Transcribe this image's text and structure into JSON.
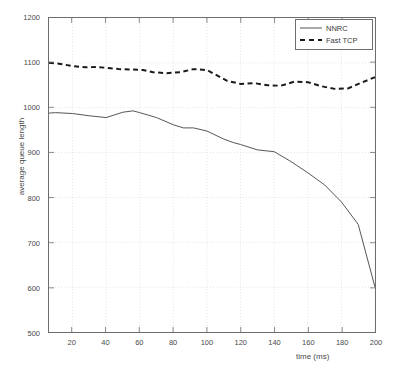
{
  "chart_data": {
    "type": "line",
    "title": "",
    "xlabel": "time (ms)",
    "ylabel": "average queue length",
    "xlim": [
      6,
      200
    ],
    "ylim": [
      500,
      1200
    ],
    "xticks": [
      20,
      40,
      60,
      80,
      100,
      120,
      140,
      160,
      180,
      200
    ],
    "yticks": [
      500,
      600,
      700,
      800,
      900,
      1000,
      1100,
      1200
    ],
    "grid": true,
    "grid_style": "dotted",
    "legend_position": "top-right",
    "series": [
      {
        "name": "NNRC",
        "style": "solid",
        "color": "#555555",
        "width": 1,
        "x": [
          6,
          10,
          20,
          30,
          40,
          50,
          56,
          60,
          70,
          80,
          86,
          92,
          100,
          110,
          116,
          120,
          130,
          140,
          150,
          160,
          170,
          180,
          190,
          200
        ],
        "y": [
          988,
          989,
          987,
          982,
          978,
          990,
          993,
          989,
          978,
          962,
          955,
          955,
          948,
          930,
          922,
          918,
          906,
          902,
          880,
          855,
          828,
          790,
          740,
          600
        ]
      },
      {
        "name": "Fast TCP",
        "style": "dashed",
        "color": "#1a1a1a",
        "width": 2,
        "x": [
          6,
          12,
          20,
          28,
          34,
          40,
          48,
          56,
          62,
          68,
          76,
          84,
          92,
          100,
          106,
          112,
          120,
          128,
          136,
          144,
          152,
          160,
          168,
          176,
          184,
          192,
          200
        ],
        "y": [
          1100,
          1098,
          1093,
          1090,
          1091,
          1089,
          1086,
          1085,
          1084,
          1079,
          1077,
          1079,
          1086,
          1084,
          1072,
          1060,
          1053,
          1055,
          1050,
          1049,
          1058,
          1057,
          1048,
          1042,
          1043,
          1056,
          1068
        ]
      }
    ]
  },
  "legend": {
    "items": [
      {
        "label": "NNRC"
      },
      {
        "label": "Fast TCP"
      }
    ]
  },
  "axes": {
    "y_tick_labels": [
      "1200",
      "1100",
      "1000",
      "900",
      "800",
      "700",
      "600",
      "500"
    ],
    "x_tick_labels": [
      "20",
      "40",
      "60",
      "80",
      "100",
      "120",
      "140",
      "160",
      "180",
      "200"
    ],
    "y_axis_title": "average queue length",
    "x_axis_title": "time (ms)"
  },
  "figure": {
    "title": ""
  }
}
